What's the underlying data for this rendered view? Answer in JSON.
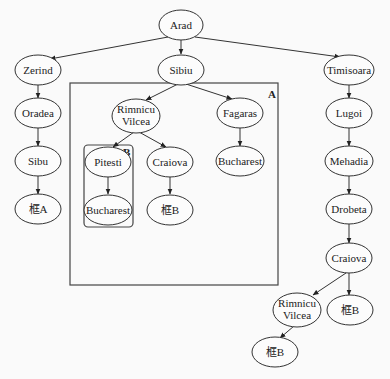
{
  "diagram": {
    "title": "",
    "nodes": {
      "arad": {
        "label": "Arad",
        "x": 181,
        "y": 25
      },
      "zerind": {
        "label": "Zerind",
        "x": 38,
        "y": 70
      },
      "sibiu": {
        "label": "Sibiu",
        "x": 181,
        "y": 70
      },
      "timisoara": {
        "label": "Timisoara",
        "x": 349,
        "y": 70
      },
      "oradea": {
        "label": "Oradea",
        "x": 38,
        "y": 113
      },
      "rimnicu1_l1": {
        "label": "Rimnicu"
      },
      "rimnicu1_l2": {
        "label": "Vilcea"
      },
      "fagaras": {
        "label": "Fagaras"
      },
      "lugoi": {
        "label": "Lugoi"
      },
      "sibu": {
        "label": "Sibu"
      },
      "pitesti": {
        "label": "Pitesti"
      },
      "craiova1": {
        "label": "Craiova"
      },
      "bucharest1": {
        "label": "Bucharest"
      },
      "mehadia": {
        "label": "Mehadia"
      },
      "frameA": {
        "label": "框A"
      },
      "bucharest2": {
        "label": "Bucharest"
      },
      "frameB1": {
        "label": "框B"
      },
      "drobeta": {
        "label": "Drobeta"
      },
      "craiova2": {
        "label": "Craiova"
      },
      "rimnicu2_l1": {
        "label": "Rimnicu"
      },
      "rimnicu2_l2": {
        "label": "Vilcea"
      },
      "frameB2": {
        "label": "框B"
      },
      "frameB3": {
        "label": "框B"
      }
    },
    "boxes": {
      "a": {
        "label": "A"
      },
      "b": {
        "label": "B"
      }
    },
    "edges": [
      [
        "Arad",
        "Zerind"
      ],
      [
        "Arad",
        "Sibiu"
      ],
      [
        "Arad",
        "Timisoara"
      ],
      [
        "Zerind",
        "Oradea"
      ],
      [
        "Oradea",
        "Sibu"
      ],
      [
        "Sibu",
        "框A"
      ],
      [
        "Sibiu",
        "Rimnicu Vilcea"
      ],
      [
        "Sibiu",
        "Fagaras"
      ],
      [
        "Rimnicu Vilcea",
        "Pitesti"
      ],
      [
        "Rimnicu Vilcea",
        "Craiova"
      ],
      [
        "Pitesti",
        "Bucharest"
      ],
      [
        "Craiova",
        "框B"
      ],
      [
        "Fagaras",
        "Bucharest"
      ],
      [
        "Timisoara",
        "Lugoi"
      ],
      [
        "Lugoi",
        "Mehadia"
      ],
      [
        "Mehadia",
        "Drobeta"
      ],
      [
        "Drobeta",
        "Craiova"
      ],
      [
        "Craiova",
        "Rimnicu Vilcea"
      ],
      [
        "Craiova",
        "框B"
      ],
      [
        "Rimnicu Vilcea",
        "框B"
      ]
    ]
  }
}
